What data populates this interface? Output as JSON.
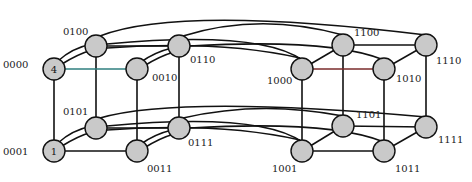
{
  "diagram": {
    "node_fill": "#c9c9c9",
    "edge_color": "#111111",
    "highlight_edges": [
      {
        "from": "0000",
        "to": "0010",
        "color": "#2f7f7f"
      },
      {
        "from": "1000",
        "to": "1010",
        "color": "#7a2b2b"
      }
    ],
    "nodes": [
      {
        "id": "0000",
        "label": "0000",
        "marker": "4",
        "x": 54,
        "y": 69
      },
      {
        "id": "0100",
        "label": "0100",
        "marker": "",
        "x": 96,
        "y": 46
      },
      {
        "id": "0010",
        "label": "0010",
        "marker": "",
        "x": 137,
        "y": 69
      },
      {
        "id": "0110",
        "label": "0110",
        "marker": "",
        "x": 179,
        "y": 46
      },
      {
        "id": "1000",
        "label": "1000",
        "marker": "",
        "x": 302,
        "y": 69
      },
      {
        "id": "1100",
        "label": "1100",
        "marker": "",
        "x": 343,
        "y": 45
      },
      {
        "id": "1010",
        "label": "1010",
        "marker": "",
        "x": 384,
        "y": 69
      },
      {
        "id": "1110",
        "label": "1110",
        "marker": "",
        "x": 426,
        "y": 45
      },
      {
        "id": "0001",
        "label": "0001",
        "marker": "1",
        "x": 54,
        "y": 151
      },
      {
        "id": "0101",
        "label": "0101",
        "marker": "",
        "x": 96,
        "y": 128
      },
      {
        "id": "0011",
        "label": "0011",
        "marker": "",
        "x": 137,
        "y": 151
      },
      {
        "id": "0111",
        "label": "0111",
        "marker": "",
        "x": 179,
        "y": 128
      },
      {
        "id": "1001",
        "label": "1001",
        "marker": "",
        "x": 302,
        "y": 151
      },
      {
        "id": "1101",
        "label": "1101",
        "marker": "",
        "x": 343,
        "y": 126
      },
      {
        "id": "1011",
        "label": "1011",
        "marker": "",
        "x": 384,
        "y": 151
      },
      {
        "id": "1111",
        "label": "1111",
        "marker": "",
        "x": 426,
        "y": 127
      }
    ]
  }
}
